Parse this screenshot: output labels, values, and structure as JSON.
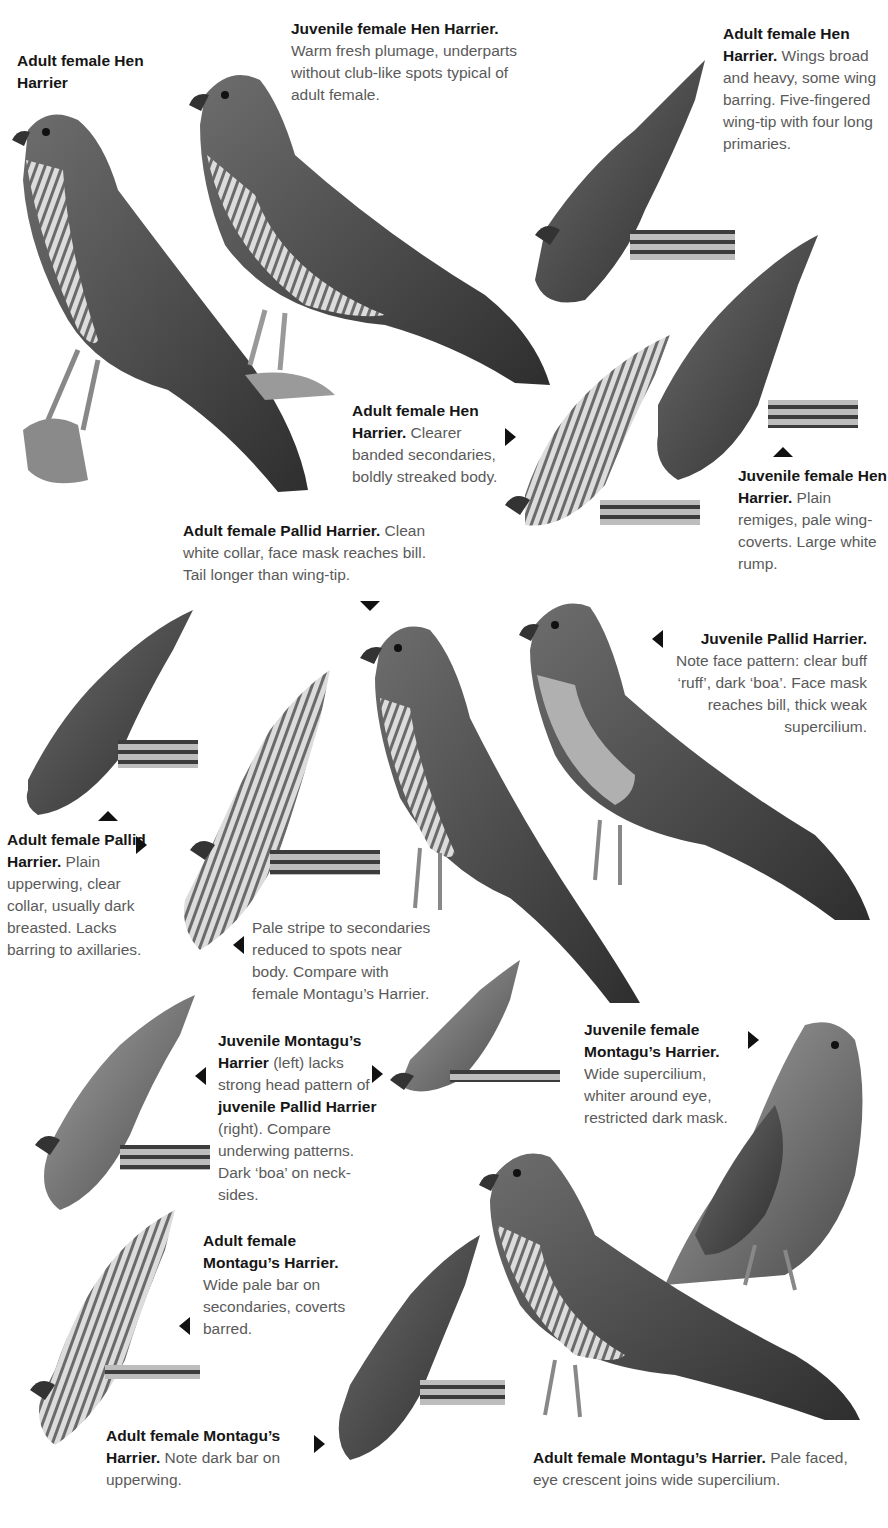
{
  "captions": [
    {
      "id": "c1",
      "title": "Adult female Hen Harrier",
      "body": ""
    },
    {
      "id": "c2",
      "title": "Juvenile female Hen Harrier.",
      "body": "Warm fresh plumage, underparts without club-like spots typical of adult female."
    },
    {
      "id": "c3",
      "title": "Adult female Hen Harrier.",
      "body": "Wings broad and heavy, some wing barring. Five-fingered wing-tip with four long primaries."
    },
    {
      "id": "c4",
      "title": "Adult female Hen Harrier.",
      "body": "Clearer banded secondaries, boldly streaked body."
    },
    {
      "id": "c5",
      "title": "Juvenile female Hen Harrier.",
      "body": "Plain remiges, pale wing-coverts. Large white rump."
    },
    {
      "id": "c6",
      "title": "Adult female Pallid Harrier.",
      "body": "Clean white collar, face mask reaches bill. Tail longer than wing-tip."
    },
    {
      "id": "c7",
      "title": "Juvenile Pallid Harrier.",
      "body": "Note face pattern: clear buff ‘ruff’, dark ‘boa’. Face mask reaches bill, thick weak supercilium."
    },
    {
      "id": "c8",
      "title": "Adult female Pallid Harrier.",
      "body": "Plain upperwing, clear collar, usually dark breasted. Lacks barring to axillaries."
    },
    {
      "id": "c9",
      "title": "",
      "body": "Pale stripe to secondaries reduced to spots near body. Compare with female Montagu’s Harrier."
    },
    {
      "id": "c10",
      "title_1": "Juvenile Montagu’s Harrier",
      "body_1": "(left) lacks strong head pattern of",
      "title_2": "juvenile Pallid Harrier",
      "body_2": "(right). Compare underwing patterns. Dark ‘boa’ on neck-sides."
    },
    {
      "id": "c11",
      "title": "Juvenile female Montagu’s Harrier.",
      "body": "Wide supercilium, whiter around eye, restricted dark mask."
    },
    {
      "id": "c12",
      "title": "Adult female Montagu’s Harrier.",
      "body": "Wide pale bar on secondaries, coverts barred."
    },
    {
      "id": "c13",
      "title": "Adult female Montagu’s Harrier.",
      "body": "Note dark bar on upperwing."
    },
    {
      "id": "c14",
      "title": "Adult female Montagu’s Harrier.",
      "body": "Pale faced, eye crescent joins wide supercilium."
    }
  ],
  "illustrations": [
    "adult-female-hen-harrier-perched",
    "juvenile-female-hen-harrier-perched",
    "adult-female-hen-harrier-flying-upper",
    "adult-female-hen-harrier-flying-under",
    "juvenile-female-hen-harrier-flying",
    "adult-female-pallid-harrier-perched",
    "juvenile-pallid-harrier-perched",
    "adult-female-pallid-harrier-flying-upper",
    "adult-female-pallid-harrier-flying-under",
    "juvenile-montagus-harrier-flying",
    "juvenile-pallid-harrier-flying",
    "juvenile-female-montagus-harrier-perched",
    "adult-female-montagus-harrier-flying-under",
    "adult-female-montagus-harrier-flying-upper",
    "adult-female-montagus-harrier-perched"
  ],
  "colors": {
    "title": "#161616",
    "body": "#5a5a5a",
    "arrow": "#111111"
  }
}
